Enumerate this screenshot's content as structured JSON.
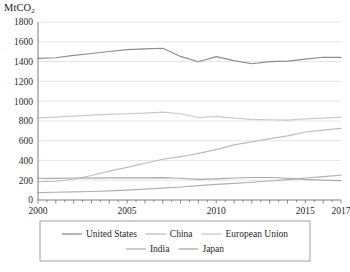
{
  "chart_data": {
    "type": "line",
    "title": "",
    "ylabel": "MtCO2",
    "ylabel_display": "MtCO",
    "ylabel_sub": "2",
    "xlabel": "",
    "x": [
      2000,
      2001,
      2002,
      2003,
      2004,
      2005,
      2006,
      2007,
      2008,
      2009,
      2010,
      2011,
      2012,
      2013,
      2014,
      2015,
      2016,
      2017
    ],
    "xlim": [
      2000,
      2017
    ],
    "ylim": [
      0,
      1800
    ],
    "xtick_labels": [
      "2000",
      "2005",
      "2010",
      "2015",
      "2017"
    ],
    "xtick_values": [
      2000,
      2005,
      2010,
      2015,
      2017
    ],
    "ytick_labels": [
      "0",
      "200",
      "400",
      "600",
      "800",
      "1000",
      "1200",
      "1400",
      "1600",
      "1800"
    ],
    "ytick_values": [
      0,
      200,
      400,
      600,
      800,
      1000,
      1200,
      1400,
      1600,
      1800
    ],
    "grid": true,
    "legend_position": "bottom",
    "series": [
      {
        "name": "United States",
        "color": "#8c8c8c",
        "values": [
          1432,
          1438,
          1462,
          1482,
          1502,
          1520,
          1528,
          1534,
          1452,
          1398,
          1450,
          1410,
          1378,
          1400,
          1404,
          1424,
          1444,
          1442
        ]
      },
      {
        "name": "China",
        "color": "#bdbdbd",
        "values": [
          185,
          190,
          210,
          248,
          292,
          330,
          372,
          412,
          438,
          472,
          510,
          558,
          588,
          620,
          648,
          688,
          706,
          724
        ]
      },
      {
        "name": "European Union",
        "color": "#c9c9c9",
        "values": [
          830,
          838,
          848,
          858,
          866,
          872,
          878,
          888,
          872,
          834,
          846,
          828,
          816,
          812,
          808,
          820,
          828,
          838
        ]
      },
      {
        "name": "India",
        "color": "#b0b0b0",
        "values": [
          74,
          78,
          82,
          86,
          92,
          100,
          110,
          120,
          132,
          146,
          158,
          168,
          180,
          192,
          206,
          222,
          236,
          250
        ]
      },
      {
        "name": "Japan",
        "color": "#a8a8a8",
        "values": [
          220,
          218,
          222,
          222,
          224,
          224,
          224,
          226,
          220,
          208,
          214,
          222,
          228,
          228,
          220,
          208,
          200,
          196
        ]
      }
    ]
  },
  "legend": {
    "row1": [
      "United States",
      "China",
      "European Union"
    ],
    "row2": [
      "India",
      "Japan"
    ]
  }
}
